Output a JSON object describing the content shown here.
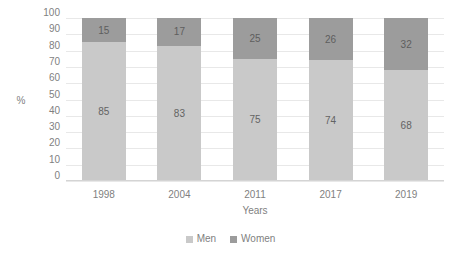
{
  "chart_data": {
    "type": "bar",
    "subtype": "stacked-100-percent",
    "title": "",
    "xlabel": "Years",
    "ylabel": "%",
    "categories": [
      "1998",
      "2004",
      "2011",
      "2017",
      "2019"
    ],
    "series": [
      {
        "name": "Men",
        "values": [
          85,
          83,
          75,
          74,
          68
        ],
        "color": "#c9c9c9"
      },
      {
        "name": "Women",
        "values": [
          15,
          17,
          25,
          26,
          32
        ],
        "color": "#9c9c9c"
      }
    ],
    "ylim": [
      0,
      100
    ],
    "ytick_labels": [
      "100",
      "90",
      "80",
      "70",
      "60",
      "50",
      "40",
      "30",
      "20",
      "10",
      "0"
    ],
    "ytick_values": [
      100,
      90,
      80,
      70,
      60,
      50,
      40,
      30,
      20,
      10,
      0
    ],
    "grid": true,
    "grid_axis": "y",
    "legend_position": "bottom",
    "data_labels": true,
    "stack_order_top_to_bottom": [
      "Women",
      "Men"
    ]
  },
  "axes": {
    "y_title": "%",
    "x_title": "Years"
  },
  "legend": {
    "items": [
      {
        "label": "Men",
        "color": "#c9c9c9"
      },
      {
        "label": "Women",
        "color": "#9c9c9c"
      }
    ]
  },
  "colors": {
    "men": "#c9c9c9",
    "women": "#9c9c9c",
    "gridline": "#e8e8e8",
    "axis": "#d4d4d4",
    "text": "#7f7f7f",
    "background": "#ffffff"
  }
}
